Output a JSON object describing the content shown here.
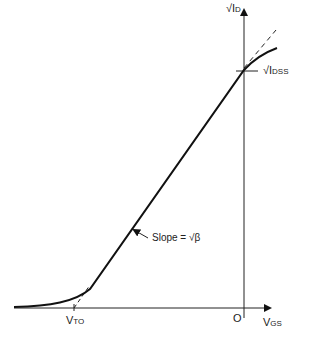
{
  "diagram": {
    "title": "",
    "y_axis_label": "√I",
    "y_axis_sub": "D",
    "x_axis_label": "V",
    "x_axis_sub": "GS",
    "origin_label": "O",
    "intercept_label": "√I",
    "intercept_sub": "DSS",
    "threshold_label": "V",
    "threshold_sub": "TO",
    "slope_label": "Slope = √β",
    "colors": {
      "line": "#111111",
      "background": "#ffffff"
    }
  }
}
